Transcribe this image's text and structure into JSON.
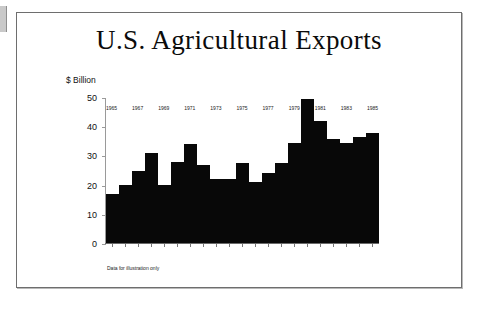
{
  "slide": {
    "title": "U.S. Agricultural Exports",
    "footnote": "Data for illustration only"
  },
  "chart_data": {
    "type": "bar",
    "title": "U.S. Agricultural Exports",
    "xlabel": "",
    "ylabel": "$ Billion",
    "ylim": [
      0,
      50
    ],
    "yticks": [
      0,
      10,
      20,
      30,
      40,
      50
    ],
    "grid": false,
    "legend": false,
    "bar_color": "#080808",
    "annotation": "Data for illustration only",
    "categories": [
      "1965",
      "1966",
      "1967",
      "1968",
      "1969",
      "1970",
      "1971",
      "1972",
      "1973",
      "1974",
      "1975",
      "1976",
      "1977",
      "1978",
      "1979",
      "1980",
      "1981",
      "1982",
      "1983",
      "1984",
      "1985"
    ],
    "xtick_labels": [
      "1965",
      "1967",
      "1969",
      "1971",
      "1973",
      "1975",
      "1977",
      "1979",
      "1981",
      "1983",
      "1985"
    ],
    "values": [
      17,
      20,
      25,
      31,
      20,
      28,
      34,
      27,
      22,
      22,
      27.5,
      21,
      24,
      27.5,
      34.5,
      49.5,
      42,
      36,
      34.5,
      36.5,
      38
    ]
  }
}
